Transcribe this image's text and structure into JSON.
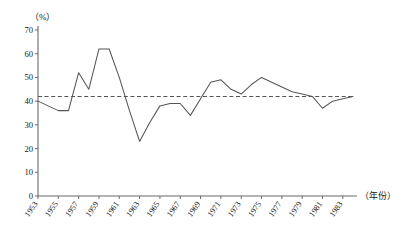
{
  "chart_data": {
    "type": "line",
    "title": "",
    "xlabel": "（年份）",
    "ylabel": "（%）",
    "ylim": [
      0,
      70
    ],
    "ytick_step": 10,
    "yticks": [
      "0",
      "10",
      "20",
      "30",
      "40",
      "50",
      "60",
      "70"
    ],
    "xlim": [
      1953,
      1984
    ],
    "xtick_step": 2,
    "xticks": [
      "1953",
      "1955",
      "1957",
      "1959",
      "1961",
      "1963",
      "1965",
      "1967",
      "1969",
      "1971",
      "1973",
      "1975",
      "1977",
      "1979",
      "1981",
      "1983"
    ],
    "grid": false,
    "legend": "none",
    "series": [
      {
        "name": "percentage",
        "x": [
          1953,
          1954,
          1955,
          1956,
          1957,
          1958,
          1959,
          1960,
          1961,
          1962,
          1963,
          1964,
          1965,
          1966,
          1967,
          1968,
          1969,
          1970,
          1971,
          1972,
          1973,
          1974,
          1975,
          1976,
          1977,
          1978,
          1979,
          1980,
          1981,
          1982,
          1983,
          1984
        ],
        "values": [
          40,
          38,
          36,
          36,
          52,
          45,
          62,
          62,
          50,
          36,
          23,
          31,
          38,
          39,
          39,
          34,
          41,
          48,
          49,
          45,
          43,
          47,
          50,
          48,
          46,
          44,
          43,
          42,
          37,
          40,
          41,
          42
        ]
      }
    ],
    "reference_line": {
      "name": "average-reference",
      "value": 42,
      "style": "dashed",
      "x_from": 1953,
      "x_to": 1984
    },
    "annotations": []
  },
  "axes": {
    "y_unit_label": "（%）",
    "x_unit_label": "（年份）"
  }
}
